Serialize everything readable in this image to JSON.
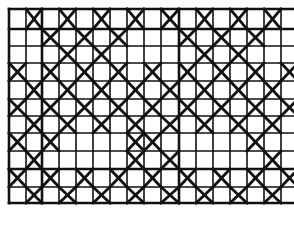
{
  "pattern": {
    "name": "cross-lattice-weave-diagram",
    "origin": {
      "x": 9,
      "y": 9
    },
    "width": 290,
    "col_lines": [
      9,
      26,
      42,
      59,
      76,
      93,
      110,
      127,
      144,
      161,
      179,
      196,
      213,
      230,
      247,
      264,
      281,
      298
    ],
    "row_lines": [
      9,
      29,
      46,
      63,
      81,
      99,
      116,
      133,
      151,
      169,
      187,
      203
    ],
    "thick_rows": [
      1,
      9
    ],
    "thick_cols": [
      2,
      10
    ],
    "line_color": "#111111",
    "background": "#ffffff",
    "crossed_cells": [
      [
        1,
        3,
        5,
        7,
        9,
        11,
        13,
        15
      ],
      [
        2,
        4,
        6,
        10,
        12,
        14
      ],
      [
        3,
        5,
        11,
        13
      ],
      [
        0,
        2,
        4,
        6,
        8,
        10,
        12,
        14,
        16
      ],
      [
        1,
        3,
        5,
        7,
        9,
        11,
        13,
        15
      ],
      [
        0,
        2,
        4,
        6,
        8,
        10,
        12,
        14,
        16
      ],
      [
        1,
        3,
        5,
        7,
        9,
        11,
        13,
        15
      ],
      [
        0,
        2,
        7,
        8,
        14
      ],
      [
        1,
        7,
        9,
        15
      ],
      [
        0,
        2,
        4,
        6,
        8,
        10,
        12,
        14,
        16
      ],
      [
        1,
        3,
        5,
        7,
        9,
        11,
        13,
        15
      ]
    ]
  }
}
